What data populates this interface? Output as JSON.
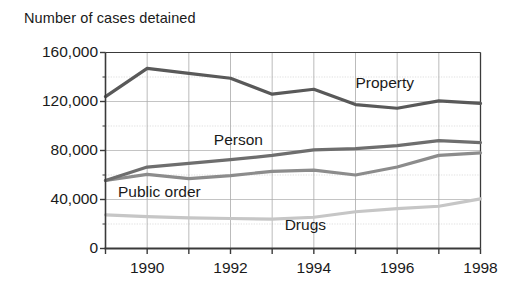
{
  "chart_data": {
    "type": "line",
    "title": "Number of cases detained",
    "xlabel": "",
    "ylabel": "",
    "ylim": [
      0,
      160000
    ],
    "xlim": [
      1989,
      1998
    ],
    "grid": true,
    "legend_position": "inline-annotations",
    "y_ticks": [
      {
        "value": 160000,
        "label": "160,000"
      },
      {
        "value": 120000,
        "label": "120,000"
      },
      {
        "value": 80000,
        "label": "80,000"
      },
      {
        "value": 40000,
        "label": "40,000"
      },
      {
        "value": 0,
        "label": "0"
      }
    ],
    "y_minor_gridlines": [
      20000,
      60000,
      100000,
      140000
    ],
    "x_ticks": [
      {
        "value": 1989,
        "label": ""
      },
      {
        "value": 1990,
        "label": "1990"
      },
      {
        "value": 1991,
        "label": ""
      },
      {
        "value": 1992,
        "label": "1992"
      },
      {
        "value": 1993,
        "label": ""
      },
      {
        "value": 1994,
        "label": "1994"
      },
      {
        "value": 1995,
        "label": ""
      },
      {
        "value": 1996,
        "label": "1996"
      },
      {
        "value": 1997,
        "label": ""
      },
      {
        "value": 1998,
        "label": "1998"
      }
    ],
    "x": [
      1989,
      1990,
      1991,
      1992,
      1993,
      1994,
      1995,
      1996,
      1997,
      1998
    ],
    "series": [
      {
        "name": "Property",
        "color": "#595959",
        "label_x": 1995.0,
        "label_y": 134000,
        "values": [
          124000,
          147000,
          143000,
          139000,
          126000,
          130000,
          117500,
          114500,
          120500,
          118500
        ]
      },
      {
        "name": "Person",
        "color": "#6e6e6e",
        "label_x": 1991.6,
        "label_y": 88000,
        "values": [
          55500,
          66500,
          69500,
          72500,
          76000,
          80500,
          81500,
          84000,
          88000,
          86500
        ]
      },
      {
        "name": "Public order",
        "color": "#8c8c8c",
        "label_x": 1989.3,
        "label_y": 45000,
        "values": [
          55500,
          60500,
          57000,
          59500,
          63000,
          64000,
          60000,
          66500,
          76000,
          78000
        ]
      },
      {
        "name": "Drugs",
        "color": "#c6c6c6",
        "label_x": 1993.3,
        "label_y": 18000,
        "values": [
          27500,
          26000,
          25000,
          24500,
          24000,
          25500,
          30000,
          32500,
          34500,
          40500
        ]
      }
    ]
  }
}
